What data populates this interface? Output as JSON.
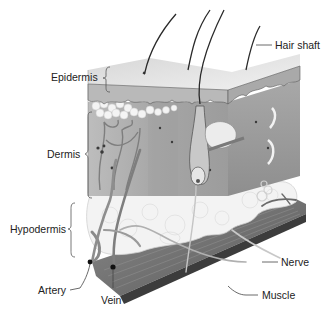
{
  "labels": {
    "hair_shaft": "Hair shaft",
    "epidermis": "Epidermis",
    "dermis": "Dermis",
    "hypodermis": "Hypodermis",
    "artery": "Artery",
    "vein": "Vein",
    "nerve": "Nerve",
    "muscle": "Muscle"
  },
  "colors": {
    "background": "#ffffff",
    "epidermis_top": "#e4e4e4",
    "epidermis_side": "#b8b8b8",
    "dermis": "#a9a9a9",
    "dermis_right": "#9a9a9a",
    "fat": "#f2f2f2",
    "muscle": "#6e6e6e",
    "muscle_edge": "#3c3c3c",
    "vessel": "#8a8a8a",
    "hair": "#2a2a2a",
    "leader": "#444444",
    "text": "#222222"
  }
}
